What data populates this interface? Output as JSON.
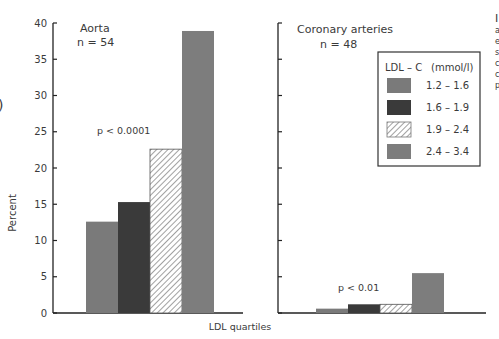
{
  "chart_data": [
    {
      "type": "bar",
      "panel": "Aorta",
      "title": "Aorta",
      "subtitle": "n = 54",
      "annotation": "p < 0.0001",
      "categories": [
        "1.2 – 1.6",
        "1.6 – 1.9",
        "1.9 – 2.4",
        "2.4 – 3.4"
      ],
      "values": [
        12.6,
        15.3,
        22.6,
        38.9
      ],
      "xlabel": "LDL quartiles",
      "ylabel": "Percent",
      "ylim": [
        0,
        40
      ],
      "yticks": [
        0,
        5,
        10,
        15,
        20,
        25,
        30,
        35,
        40
      ],
      "grid": false
    },
    {
      "type": "bar",
      "panel": "Coronary arteries",
      "title": "Coronary arteries",
      "subtitle": "n = 48",
      "annotation": "p < 0.01",
      "categories": [
        "1.2 – 1.6",
        "1.6 – 1.9",
        "1.9 – 2.4",
        "2.4 – 3.4"
      ],
      "values": [
        0.6,
        1.2,
        1.2,
        5.5
      ],
      "xlabel": "LDL quartiles",
      "ylabel": "Percent",
      "ylim": [
        0,
        40
      ],
      "yticks": [
        0,
        5,
        10,
        15,
        20,
        25,
        30,
        35,
        40
      ],
      "grid": false
    }
  ],
  "axes": {
    "ylabel": "Percent",
    "xlabel": "LDL quartiles",
    "ytick_labels": [
      "0",
      "5",
      "10",
      "15",
      "20",
      "25",
      "30",
      "35",
      "40"
    ]
  },
  "panels": {
    "aorta": {
      "title": "Aorta",
      "n": "n = 54",
      "p": "p < 0.0001"
    },
    "coronary": {
      "title": "Coronary arteries",
      "n": "n = 48",
      "p": "p < 0.01"
    }
  },
  "legend": {
    "title": "LDL – C",
    "unit": "(mmol/l)",
    "items": [
      {
        "label": "1.2 – 1.6",
        "color": "#7a7a7a",
        "pattern": "solid"
      },
      {
        "label": "1.6 – 1.9",
        "color": "#3a3a3a",
        "pattern": "solid"
      },
      {
        "label": "1.9 – 2.4",
        "color": "#ffffff",
        "pattern": "hatch"
      },
      {
        "label": "2.4 – 3.4",
        "color": "#7d7d7d",
        "pattern": "solid"
      }
    ]
  },
  "cropped_fragments": {
    "left_paren": ")",
    "right_column": [
      "I",
      "a",
      "e",
      "s",
      "c",
      "c",
      "p"
    ]
  }
}
